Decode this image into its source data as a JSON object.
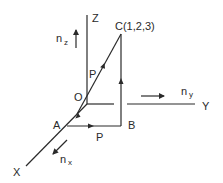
{
  "diagram": {
    "type": "3d-coordinate-vector-diagram",
    "colors": {
      "stroke": "#2a2a2a",
      "background": "#ffffff"
    },
    "axes": {
      "z": {
        "label": "Z"
      },
      "y": {
        "label": "Y"
      },
      "x": {
        "label": "X"
      }
    },
    "unit_vectors": {
      "nz": {
        "base": "n",
        "sub": "z"
      },
      "ny": {
        "base": "n",
        "sub": "y"
      },
      "nx": {
        "base": "n",
        "sub": "x"
      }
    },
    "points": {
      "origin": {
        "label": "O"
      },
      "a": {
        "label": "A"
      },
      "b": {
        "label": "B"
      },
      "c": {
        "label": "C(1,2,3)"
      }
    },
    "vectors": {
      "oc": {
        "label": "P"
      },
      "ab": {
        "label": "P"
      }
    }
  }
}
